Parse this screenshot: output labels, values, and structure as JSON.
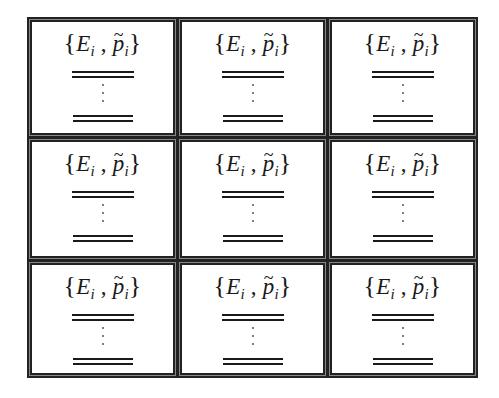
{
  "diagram": {
    "layout": "3x3 grid of bordered cells",
    "rows": 3,
    "columns": 3,
    "cells": [
      {
        "formula_prefix": "{",
        "var1": "E",
        "sub1": "i",
        "separator": " , ",
        "var2": "p",
        "tilde": "~",
        "sub2": "i",
        "formula_suffix": "}"
      },
      {
        "formula_prefix": "{",
        "var1": "E",
        "sub1": "i",
        "separator": " , ",
        "var2": "p",
        "tilde": "~",
        "sub2": "i",
        "formula_suffix": "}"
      },
      {
        "formula_prefix": "{",
        "var1": "E",
        "sub1": "i",
        "separator": " , ",
        "var2": "p",
        "tilde": "~",
        "sub2": "i",
        "formula_suffix": "}"
      },
      {
        "formula_prefix": "{",
        "var1": "E",
        "sub1": "i",
        "separator": " , ",
        "var2": "p",
        "tilde": "~",
        "sub2": "i",
        "formula_suffix": "}"
      },
      {
        "formula_prefix": "{",
        "var1": "E",
        "sub1": "i",
        "separator": " , ",
        "var2": "p",
        "tilde": "~",
        "sub2": "i",
        "formula_suffix": "}"
      },
      {
        "formula_prefix": "{",
        "var1": "E",
        "sub1": "i",
        "separator": " , ",
        "var2": "p",
        "tilde": "~",
        "sub2": "i",
        "formula_suffix": "}"
      },
      {
        "formula_prefix": "{",
        "var1": "E",
        "sub1": "i",
        "separator": " , ",
        "var2": "p",
        "tilde": "~",
        "sub2": "i",
        "formula_suffix": "}"
      },
      {
        "formula_prefix": "{",
        "var1": "E",
        "sub1": "i",
        "separator": " , ",
        "var2": "p",
        "tilde": "~",
        "sub2": "i",
        "formula_suffix": "}"
      },
      {
        "formula_prefix": "{",
        "var1": "E",
        "sub1": "i",
        "separator": " , ",
        "var2": "p",
        "tilde": "~",
        "sub2": "i",
        "formula_suffix": "}"
      }
    ],
    "colors": {
      "border": "#222222",
      "border_mid": "#888888",
      "text": "#1a1a1a",
      "background": "#ffffff"
    }
  }
}
